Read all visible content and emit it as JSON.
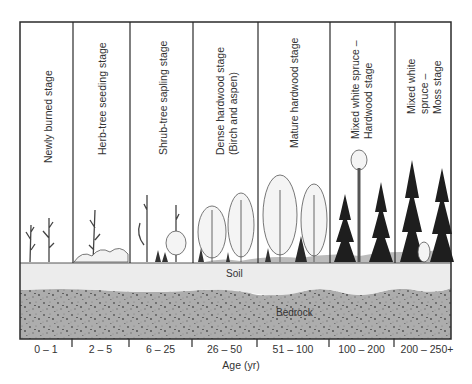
{
  "diagram": {
    "stages": [
      {
        "label": "Newly burned stage",
        "age": "0 – 1"
      },
      {
        "label": "Herb-tree seeding stage",
        "age": "2 – 5"
      },
      {
        "label": "Shrub-tree sapling stage",
        "age": "6 – 25"
      },
      {
        "label": "Dense hardwood stage",
        "label2": "(Birch and aspen)",
        "age": "26 – 50"
      },
      {
        "label": "Mature hardwood stage",
        "age": "51 – 100"
      },
      {
        "label": "Mixed white spruce –",
        "label2": "Hardwood stage",
        "age": "100 – 200"
      },
      {
        "label": "Mixed white",
        "label2": "spruce –",
        "label3": "Moss stage",
        "age": "200 – 250+"
      }
    ],
    "layers": {
      "soil": "Soil",
      "bedrock": "Bedrock"
    },
    "axis": {
      "title": "Age (yr)"
    },
    "colors": {
      "frame": "#2b2b2b",
      "soil": "#ececec",
      "bedrock": "#a9a9a9",
      "conifer": "#1e1e1e",
      "hardwood": "#f4f4f4"
    }
  }
}
